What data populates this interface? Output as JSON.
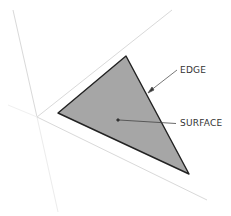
{
  "diagram": {
    "labels": {
      "edge": "EDGE",
      "surface": "SURFACE"
    },
    "colors": {
      "background": "#ffffff",
      "surface_fill": "#a6a6a6",
      "edge_stroke": "#222222",
      "axis_stroke": "#d9d9d9",
      "leader_stroke": "#555555",
      "label_text": "#333333"
    }
  }
}
